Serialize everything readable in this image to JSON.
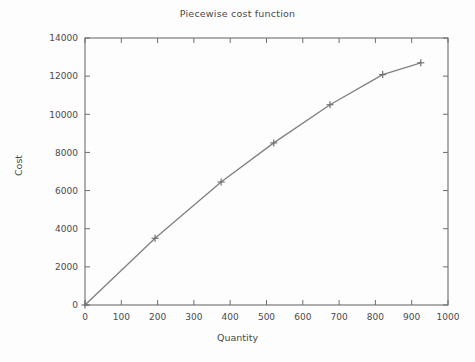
{
  "chart_data": {
    "type": "line",
    "title": "Piecewise cost function",
    "xlabel": "Quantity",
    "ylabel": "Cost",
    "x": [
      0,
      193,
      375,
      520,
      675,
      820,
      925
    ],
    "values": [
      0,
      3500,
      6450,
      8500,
      10500,
      12080,
      12700
    ],
    "series": [
      {
        "name": "Piecewise cost function",
        "x": [
          0,
          193,
          375,
          520,
          675,
          820,
          925
        ],
        "values": [
          0,
          3500,
          6450,
          8500,
          10500,
          12080,
          12700
        ]
      }
    ],
    "xlim": [
      0,
      1000
    ],
    "ylim": [
      0,
      14000
    ],
    "xticks": [
      0,
      100,
      200,
      300,
      400,
      500,
      600,
      700,
      800,
      900,
      1000
    ],
    "yticks": [
      0,
      2000,
      4000,
      6000,
      8000,
      10000,
      12000,
      14000
    ],
    "xtick_labels": [
      "0",
      "100",
      "200",
      "300",
      "400",
      "500",
      "600",
      "700",
      "800",
      "900",
      "1000"
    ],
    "ytick_labels": [
      "0",
      "2000",
      "4000",
      "6000",
      "8000",
      "10000",
      "12000",
      "14000"
    ],
    "grid": false,
    "legend": false,
    "legend_position": "none",
    "marker": "plus",
    "line_color": "#808080",
    "marker_color": "#707070",
    "axis_color": "#6e6e6e",
    "background_color": "#fdfdfd",
    "text_color": "#4a4a4a"
  }
}
